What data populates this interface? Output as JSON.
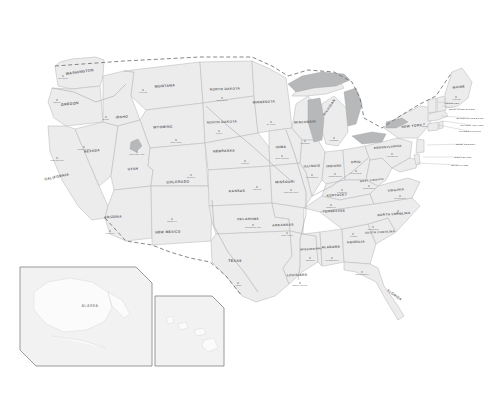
{
  "map": {
    "title": "United States Map",
    "background_color": "#ffffff",
    "land_fill": "#ececed",
    "border_color": "#b9babb",
    "lake_fill": "#b6b8ba",
    "label_color": "#5d5f62",
    "capital_color": "#76787b",
    "international_border_style": "dashed",
    "states": [
      {
        "name": "WASHINGTON",
        "x": 80,
        "y": 73,
        "size": 3.6,
        "rot": -8,
        "capital": "Olympia",
        "cx": 63,
        "cy": 76
      },
      {
        "name": "OREGON",
        "x": 70,
        "y": 105,
        "size": 3.6,
        "rot": -6,
        "capital": "Salem",
        "cx": 57,
        "cy": 100
      },
      {
        "name": "IDAHO",
        "x": 122,
        "y": 118,
        "size": 3.4,
        "rot": -4,
        "capital": "Boise",
        "cx": 106,
        "cy": 117
      },
      {
        "name": "MONTANA",
        "x": 165,
        "y": 87,
        "size": 3.6,
        "rot": -4,
        "capital": "Helena",
        "cx": 143,
        "cy": 90
      },
      {
        "name": "WYOMING",
        "x": 163,
        "y": 128,
        "size": 3.4,
        "rot": -3,
        "capital": "Cheyenne",
        "cx": 176,
        "cy": 140
      },
      {
        "name": "NEVADA",
        "x": 92,
        "y": 152,
        "size": 3.4,
        "rot": -5,
        "capital": "Carson City",
        "cx": 84,
        "cy": 147
      },
      {
        "name": "UTAH",
        "x": 133,
        "y": 170,
        "size": 3.4,
        "rot": -3,
        "capital": "Salt Lake City",
        "cx": 137,
        "cy": 152
      },
      {
        "name": "CALIFORNIA",
        "x": 57,
        "y": 178,
        "size": 3.5,
        "rot": -12,
        "capital": "Sacramento",
        "cx": 57,
        "cy": 158
      },
      {
        "name": "ARIZONA",
        "x": 113,
        "y": 218,
        "size": 3.4,
        "rot": -3,
        "capital": "Phoenix",
        "cx": 110,
        "cy": 231
      },
      {
        "name": "NEW MEXICO",
        "x": 168,
        "y": 233,
        "size": 3.4,
        "rot": -2,
        "capital": "Santa Fe",
        "cx": 172,
        "cy": 219
      },
      {
        "name": "COLORADO",
        "x": 178,
        "y": 183,
        "size": 3.5,
        "rot": -2,
        "capital": "Denver",
        "cx": 191,
        "cy": 175
      },
      {
        "name": "NORTH DAKOTA",
        "x": 225,
        "y": 90,
        "size": 3.3,
        "rot": -2,
        "capital": "Bismarck",
        "cx": 222,
        "cy": 98
      },
      {
        "name": "SOUTH DAKOTA",
        "x": 222,
        "y": 123,
        "size": 3.3,
        "rot": -2,
        "capital": "Pierre",
        "cx": 219,
        "cy": 131
      },
      {
        "name": "NEBRASKA",
        "x": 224,
        "y": 152,
        "size": 3.4,
        "rot": -2,
        "capital": "Lincoln",
        "cx": 245,
        "cy": 161
      },
      {
        "name": "KANSAS",
        "x": 237,
        "y": 192,
        "size": 3.4,
        "rot": -1,
        "capital": "Topeka",
        "cx": 257,
        "cy": 187
      },
      {
        "name": "OKLAHOMA",
        "x": 248,
        "y": 220,
        "size": 3.3,
        "rot": -1,
        "capital": "Oklahoma City",
        "cx": 253,
        "cy": 225
      },
      {
        "name": "TEXAS",
        "x": 235,
        "y": 262,
        "size": 3.6,
        "rot": -1,
        "capital": "Austin",
        "cx": 238,
        "cy": 283
      },
      {
        "name": "MINNESOTA",
        "x": 264,
        "y": 103,
        "size": 3.3,
        "rot": -3,
        "capital": "St. Paul",
        "cx": 271,
        "cy": 122
      },
      {
        "name": "IOWA",
        "x": 281,
        "y": 148,
        "size": 3.4,
        "rot": -2,
        "capital": "Des Moines",
        "cx": 282,
        "cy": 156
      },
      {
        "name": "MISSOURI",
        "x": 285,
        "y": 183,
        "size": 3.4,
        "rot": -2,
        "capital": "Jefferson City",
        "cx": 291,
        "cy": 190
      },
      {
        "name": "ARKANSAS",
        "x": 283,
        "y": 226,
        "size": 3.3,
        "rot": -2,
        "capital": "Little Rock",
        "cx": 287,
        "cy": 233
      },
      {
        "name": "LOUISIANA",
        "x": 297,
        "y": 276,
        "size": 3.2,
        "rot": -2,
        "capital": "Baton Rouge",
        "cx": 300,
        "cy": 283
      },
      {
        "name": "WISCONSIN",
        "x": 305,
        "y": 123,
        "size": 3.3,
        "rot": -3,
        "capital": "Madison",
        "cx": 305,
        "cy": 141
      },
      {
        "name": "ILLINOIS",
        "x": 312,
        "y": 167,
        "size": 3.3,
        "rot": -3,
        "capital": "Springfield",
        "cx": 312,
        "cy": 175
      },
      {
        "name": "MICHIGAN",
        "x": 330,
        "y": 108,
        "size": 3.3,
        "rot": -55,
        "capital": "Lansing",
        "cx": 334,
        "cy": 138
      },
      {
        "name": "INDIANA",
        "x": 334,
        "y": 167,
        "size": 3.1,
        "rot": -3,
        "capital": "Indianapolis",
        "cx": 335,
        "cy": 174
      },
      {
        "name": "OHIO",
        "x": 356,
        "y": 163,
        "size": 3.3,
        "rot": -3,
        "capital": "Columbus",
        "cx": 356,
        "cy": 171
      },
      {
        "name": "KENTUCKY",
        "x": 337,
        "y": 196,
        "size": 3.2,
        "rot": -4,
        "capital": "Frankfort",
        "cx": 342,
        "cy": 190
      },
      {
        "name": "TENNESSEE",
        "x": 334,
        "y": 212,
        "size": 3.2,
        "rot": -3,
        "capital": "Nashville",
        "cx": 331,
        "cy": 205
      },
      {
        "name": "MISSISSIPPI",
        "x": 311,
        "y": 250,
        "size": 3.0,
        "rot": -2,
        "capital": "Jackson",
        "cx": 310,
        "cy": 258
      },
      {
        "name": "ALABAMA",
        "x": 331,
        "y": 248,
        "size": 3.2,
        "rot": -2,
        "capital": "Montgomery",
        "cx": 332,
        "cy": 258
      },
      {
        "name": "GEORGIA",
        "x": 356,
        "y": 243,
        "size": 3.3,
        "rot": -2,
        "capital": "Atlanta",
        "cx": 353,
        "cy": 234
      },
      {
        "name": "FLORIDA",
        "x": 394,
        "y": 296,
        "size": 3.3,
        "rot": 35,
        "capital": "Tallahassee",
        "cx": 362,
        "cy": 272
      },
      {
        "name": "SOUTH CAROLINA",
        "x": 380,
        "y": 233,
        "size": 2.8,
        "rot": -3,
        "capital": "Columbia",
        "cx": 373,
        "cy": 227
      },
      {
        "name": "NORTH CAROLINA",
        "x": 394,
        "y": 215,
        "size": 3.1,
        "rot": -4,
        "capital": "Raleigh",
        "cx": 398,
        "cy": 211
      },
      {
        "name": "VIRGINIA",
        "x": 396,
        "y": 191,
        "size": 3.1,
        "rot": -5,
        "capital": "Richmond",
        "cx": 400,
        "cy": 196
      },
      {
        "name": "WEST VIRGINIA",
        "x": 372,
        "y": 181,
        "size": 2.6,
        "rot": -6,
        "capital": "Charleston",
        "cx": 369,
        "cy": 186
      },
      {
        "name": "PENNSYLVANIA",
        "x": 388,
        "y": 148,
        "size": 3.1,
        "rot": -5,
        "capital": "Harrisburg",
        "cx": 392,
        "cy": 154
      },
      {
        "name": "NEW YORK",
        "x": 412,
        "y": 127,
        "size": 3.3,
        "rot": -6,
        "capital": "Albany",
        "cx": 424,
        "cy": 124
      },
      {
        "name": "MAINE",
        "x": 459,
        "y": 88,
        "size": 3.3,
        "rot": -6,
        "capital": "Augusta",
        "cx": 456,
        "cy": 97
      }
    ],
    "callout_states": [
      {
        "name": "VERMONT",
        "x": 452,
        "y": 104,
        "lx": 437,
        "ly": 102
      },
      {
        "name": "NEW HAMPSHIRE",
        "x": 462,
        "y": 110,
        "lx": 442,
        "ly": 106
      },
      {
        "name": "MASSACHUSETTS",
        "x": 470,
        "y": 119,
        "lx": 441,
        "ly": 116
      },
      {
        "name": "RHODE ISLAND",
        "x": 472,
        "y": 126,
        "lx": 443,
        "ly": 121
      },
      {
        "name": "CONNECTICUT",
        "x": 470,
        "y": 132,
        "lx": 438,
        "ly": 125
      },
      {
        "name": "NEW JERSEY",
        "x": 466,
        "y": 145,
        "lx": 427,
        "ly": 145
      },
      {
        "name": "DELAWARE",
        "x": 463,
        "y": 158,
        "lx": 423,
        "ly": 157
      },
      {
        "name": "MARYLAND",
        "x": 460,
        "y": 166,
        "lx": 417,
        "ly": 163
      }
    ],
    "lakes": [
      {
        "name": "Lake Superior"
      },
      {
        "name": "Lake Michigan"
      },
      {
        "name": "Lake Huron"
      },
      {
        "name": "Lake Erie"
      },
      {
        "name": "Lake Ontario"
      },
      {
        "name": "Great Salt Lake"
      }
    ],
    "insets": [
      {
        "id": "alaska",
        "label": "ALASKA",
        "label_x": 90,
        "label_y": 307
      },
      {
        "id": "hawaii",
        "label": "",
        "label_x": 190,
        "label_y": 332
      }
    ]
  }
}
